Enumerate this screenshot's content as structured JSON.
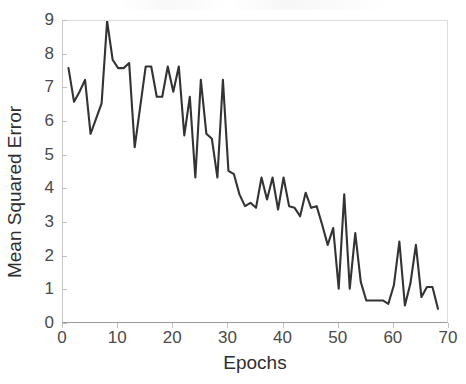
{
  "chart_data": {
    "type": "line",
    "title": "",
    "xlabel": "Epochs",
    "ylabel": "Mean Squared Error",
    "xlim": [
      0,
      70
    ],
    "ylim": [
      0,
      9
    ],
    "xticks": [
      0,
      10,
      20,
      30,
      40,
      50,
      60,
      70
    ],
    "yticks": [
      0,
      1,
      2,
      3,
      4,
      5,
      6,
      7,
      8,
      9
    ],
    "grid": false,
    "legend": null,
    "line_color": "#333333",
    "line_width": 2.1,
    "series": [
      {
        "name": "Mean Squared Error",
        "x": [
          1,
          2,
          3,
          4,
          5,
          6,
          7,
          8,
          9,
          10,
          11,
          12,
          13,
          14,
          15,
          16,
          17,
          18,
          19,
          20,
          21,
          22,
          23,
          24,
          25,
          26,
          27,
          28,
          29,
          30,
          31,
          32,
          33,
          34,
          35,
          36,
          37,
          38,
          39,
          40,
          41,
          42,
          43,
          44,
          45,
          46,
          47,
          48,
          49,
          50,
          51,
          52,
          53,
          54,
          55,
          56,
          57,
          58,
          59,
          60,
          61,
          62,
          63,
          64,
          65,
          66,
          67,
          68
        ],
        "values": [
          7.6,
          6.6,
          6.9,
          7.25,
          5.65,
          6.1,
          6.55,
          9.0,
          7.85,
          7.6,
          7.6,
          7.75,
          5.25,
          6.45,
          7.65,
          7.65,
          6.75,
          6.75,
          7.65,
          6.9,
          7.65,
          5.6,
          6.75,
          4.35,
          7.25,
          5.65,
          5.5,
          4.35,
          7.25,
          4.55,
          4.45,
          3.85,
          3.5,
          3.6,
          3.45,
          4.35,
          3.7,
          4.35,
          3.4,
          4.35,
          3.5,
          3.45,
          3.2,
          3.9,
          3.45,
          3.5,
          2.95,
          2.35,
          2.85,
          1.05,
          3.85,
          1.05,
          2.7,
          1.25,
          0.7,
          0.7,
          0.7,
          0.7,
          0.6,
          1.15,
          2.45,
          0.55,
          1.2,
          2.35,
          0.8,
          1.1,
          1.1,
          0.45
        ]
      }
    ]
  },
  "axes": {
    "ylabel_text": "Mean Squared Error",
    "xlabel_text": "Epochs",
    "ytick_labels": [
      "0",
      "1",
      "2",
      "3",
      "4",
      "5",
      "6",
      "7",
      "8",
      "9"
    ],
    "xtick_labels": [
      "0",
      "10",
      "20",
      "30",
      "40",
      "50",
      "60",
      "70"
    ]
  }
}
